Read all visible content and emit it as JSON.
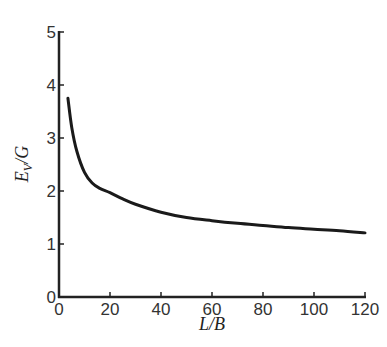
{
  "chart_data": {
    "type": "line",
    "title": "",
    "xlabel": "L/B",
    "ylabel": "E_V/G",
    "ylabel_main": "E",
    "ylabel_sub": "V",
    "ylabel_rest": "/G",
    "xlim": [
      0,
      120
    ],
    "ylim": [
      0,
      5
    ],
    "xticks": [
      0,
      20,
      40,
      60,
      80,
      100,
      120
    ],
    "yticks": [
      0,
      1,
      2,
      3,
      4,
      5
    ],
    "grid": false,
    "legend": "none",
    "series": [
      {
        "name": "E_V/G vs L/B",
        "x": [
          3.5,
          5,
          7,
          10,
          13,
          16,
          20,
          25,
          30,
          40,
          50,
          60,
          70,
          80,
          90,
          100,
          110,
          120
        ],
        "y": [
          3.75,
          3.2,
          2.75,
          2.35,
          2.15,
          2.05,
          1.97,
          1.85,
          1.75,
          1.6,
          1.5,
          1.44,
          1.39,
          1.35,
          1.31,
          1.28,
          1.25,
          1.21
        ]
      }
    ]
  }
}
